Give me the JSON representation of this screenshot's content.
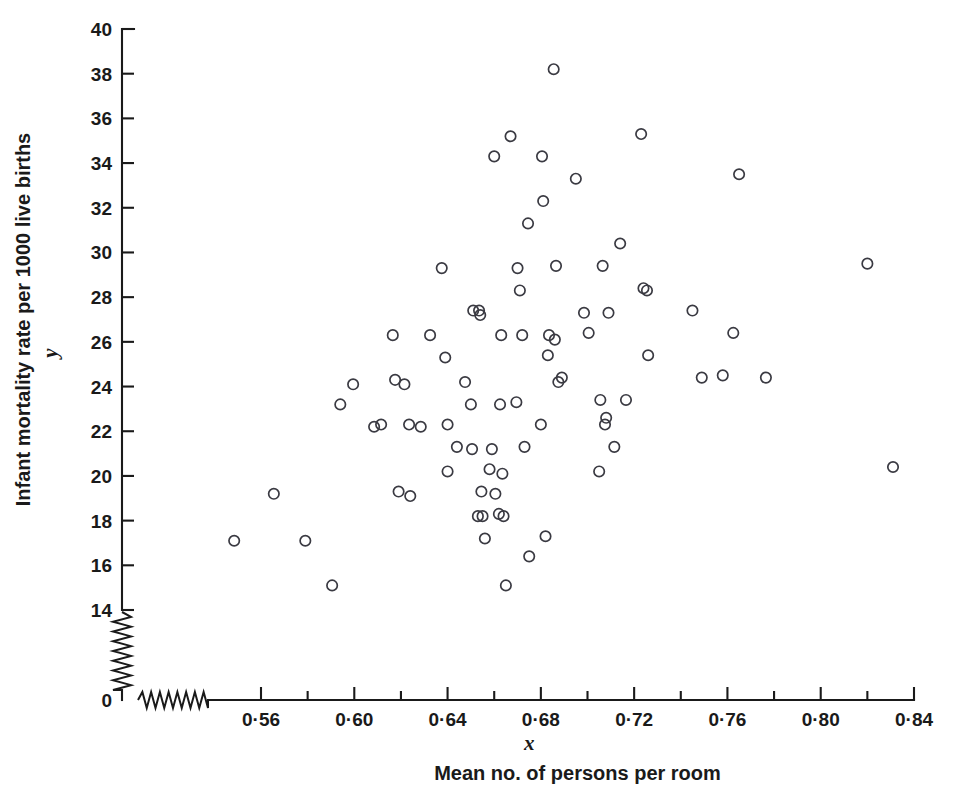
{
  "chart_data": {
    "type": "scatter",
    "title": "",
    "xlabel": "Mean no. of persons per room",
    "ylabel": "Infant mortality rate per 1000 live births",
    "x_var_symbol": "x",
    "y_var_symbol": "y",
    "xlim": [
      0.54,
      0.84
    ],
    "ylim": [
      14,
      40
    ],
    "y_origin_label": "0",
    "grid": false,
    "legend": null,
    "axis_break_x": true,
    "axis_break_y": true,
    "x_tick_labels": [
      "0·56",
      "0·60",
      "0·64",
      "0·68",
      "0·72",
      "0·76",
      "0·80",
      "0·84"
    ],
    "x_tick_values": [
      0.56,
      0.6,
      0.64,
      0.68,
      0.72,
      0.76,
      0.8,
      0.84
    ],
    "x_minor_tick_values": [
      0.58,
      0.62,
      0.66,
      0.7,
      0.74,
      0.78,
      0.82
    ],
    "y_tick_labels": [
      "14",
      "16",
      "18",
      "20",
      "22",
      "24",
      "26",
      "28",
      "30",
      "32",
      "34",
      "36",
      "38",
      "40"
    ],
    "y_tick_values": [
      14,
      16,
      18,
      20,
      22,
      24,
      26,
      28,
      30,
      32,
      34,
      36,
      38,
      40
    ],
    "marker": "open-circle",
    "marker_color": "#3a3a42",
    "points": [
      {
        "x": 0.5485,
        "y": 17.1
      },
      {
        "x": 0.5655,
        "y": 19.2
      },
      {
        "x": 0.579,
        "y": 17.1
      },
      {
        "x": 0.5905,
        "y": 15.1
      },
      {
        "x": 0.594,
        "y": 23.2
      },
      {
        "x": 0.5995,
        "y": 24.1
      },
      {
        "x": 0.6085,
        "y": 22.2
      },
      {
        "x": 0.6115,
        "y": 22.3
      },
      {
        "x": 0.6165,
        "y": 26.3
      },
      {
        "x": 0.6175,
        "y": 24.3
      },
      {
        "x": 0.619,
        "y": 19.3
      },
      {
        "x": 0.6215,
        "y": 24.1
      },
      {
        "x": 0.6235,
        "y": 22.3
      },
      {
        "x": 0.624,
        "y": 19.1
      },
      {
        "x": 0.6285,
        "y": 22.2
      },
      {
        "x": 0.6325,
        "y": 26.3
      },
      {
        "x": 0.6375,
        "y": 29.3
      },
      {
        "x": 0.639,
        "y": 25.3
      },
      {
        "x": 0.64,
        "y": 22.3
      },
      {
        "x": 0.64,
        "y": 20.2
      },
      {
        "x": 0.644,
        "y": 21.3
      },
      {
        "x": 0.6475,
        "y": 24.2
      },
      {
        "x": 0.65,
        "y": 23.2
      },
      {
        "x": 0.6505,
        "y": 21.2
      },
      {
        "x": 0.651,
        "y": 27.4
      },
      {
        "x": 0.653,
        "y": 18.2
      },
      {
        "x": 0.6535,
        "y": 27.4
      },
      {
        "x": 0.654,
        "y": 27.2
      },
      {
        "x": 0.6545,
        "y": 19.3
      },
      {
        "x": 0.655,
        "y": 18.2
      },
      {
        "x": 0.656,
        "y": 17.2
      },
      {
        "x": 0.658,
        "y": 20.3
      },
      {
        "x": 0.659,
        "y": 21.2
      },
      {
        "x": 0.66,
        "y": 34.3
      },
      {
        "x": 0.6605,
        "y": 19.2
      },
      {
        "x": 0.662,
        "y": 18.3
      },
      {
        "x": 0.6625,
        "y": 23.2
      },
      {
        "x": 0.663,
        "y": 26.3
      },
      {
        "x": 0.6635,
        "y": 20.1
      },
      {
        "x": 0.664,
        "y": 18.2
      },
      {
        "x": 0.665,
        "y": 15.1
      },
      {
        "x": 0.667,
        "y": 35.2
      },
      {
        "x": 0.6695,
        "y": 23.3
      },
      {
        "x": 0.67,
        "y": 29.3
      },
      {
        "x": 0.671,
        "y": 28.3
      },
      {
        "x": 0.672,
        "y": 26.3
      },
      {
        "x": 0.673,
        "y": 21.3
      },
      {
        "x": 0.6745,
        "y": 31.3
      },
      {
        "x": 0.675,
        "y": 16.4
      },
      {
        "x": 0.68,
        "y": 22.3
      },
      {
        "x": 0.6805,
        "y": 34.3
      },
      {
        "x": 0.681,
        "y": 32.3
      },
      {
        "x": 0.682,
        "y": 17.3
      },
      {
        "x": 0.683,
        "y": 25.4
      },
      {
        "x": 0.6835,
        "y": 26.3
      },
      {
        "x": 0.6855,
        "y": 38.2
      },
      {
        "x": 0.686,
        "y": 26.1
      },
      {
        "x": 0.6865,
        "y": 29.4
      },
      {
        "x": 0.6875,
        "y": 24.2
      },
      {
        "x": 0.689,
        "y": 24.4
      },
      {
        "x": 0.695,
        "y": 33.3
      },
      {
        "x": 0.6985,
        "y": 27.3
      },
      {
        "x": 0.7005,
        "y": 26.4
      },
      {
        "x": 0.705,
        "y": 20.2
      },
      {
        "x": 0.7055,
        "y": 23.4
      },
      {
        "x": 0.7065,
        "y": 29.4
      },
      {
        "x": 0.7075,
        "y": 22.3
      },
      {
        "x": 0.708,
        "y": 22.6
      },
      {
        "x": 0.709,
        "y": 27.3
      },
      {
        "x": 0.7115,
        "y": 21.3
      },
      {
        "x": 0.714,
        "y": 30.4
      },
      {
        "x": 0.7165,
        "y": 23.4
      },
      {
        "x": 0.723,
        "y": 35.3
      },
      {
        "x": 0.724,
        "y": 28.4
      },
      {
        "x": 0.7255,
        "y": 28.3
      },
      {
        "x": 0.726,
        "y": 25.4
      },
      {
        "x": 0.745,
        "y": 27.4
      },
      {
        "x": 0.749,
        "y": 24.4
      },
      {
        "x": 0.758,
        "y": 24.5
      },
      {
        "x": 0.7625,
        "y": 26.4
      },
      {
        "x": 0.765,
        "y": 33.5
      },
      {
        "x": 0.7765,
        "y": 24.4
      },
      {
        "x": 0.82,
        "y": 29.5
      },
      {
        "x": 0.831,
        "y": 20.4
      }
    ]
  },
  "figure": {
    "background": "#ffffff",
    "foreground": "#1a1a1a"
  }
}
